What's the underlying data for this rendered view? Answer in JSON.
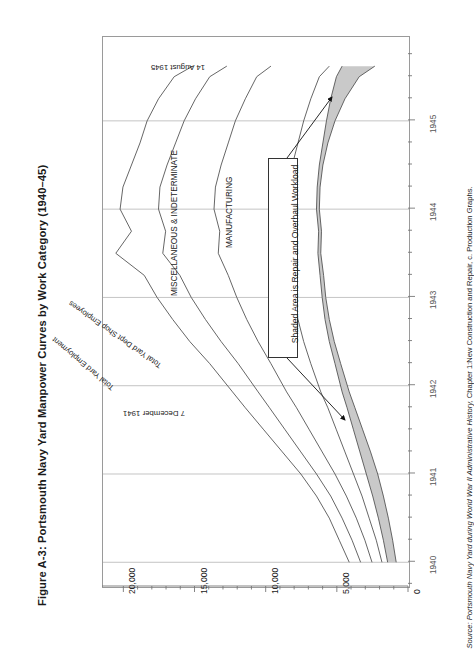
{
  "figure": {
    "title": "Figure A-3: Portsmouth Navy Yard Manpower Curves by Work Category (1940–45)",
    "source_prefix": "Source: ",
    "source_italic": "Portsmouth Navy Yard during World War II Administrative History,",
    "source_rest": " Chapter 1:New Construction and Repair, c. Production Graphs."
  },
  "axes": {
    "value_axis": {
      "title": "",
      "ticks": [
        "20,000",
        "15,000",
        "10,000",
        "5,000",
        "0"
      ],
      "tick_values": [
        20000,
        15000,
        10000,
        5000,
        0
      ],
      "minor_step": 1000,
      "min": 0,
      "max": 21500
    },
    "year_axis": {
      "ticks": [
        "1940",
        "1941",
        "1942",
        "1943",
        "1944",
        "1945"
      ],
      "tick_values": [
        1940,
        1941,
        1942,
        1943,
        1944,
        1945
      ],
      "min": 1939.72,
      "max": 1945.95,
      "minor_step": 0.25
    }
  },
  "series_labels": {
    "total_yard_employment": "Total Yard Employment",
    "total_yard_dept_shop": "Total Yard Dept Shop Employees",
    "miscellaneous": "MISCELLANEOUS & INDETERMINATE",
    "manufacturing": "MANUFACTURING",
    "new_construction": "NEW CONSTRUCTION"
  },
  "event_labels": {
    "pearl_harbor": "7 December 1941",
    "v_j_day": "14 August 1945"
  },
  "annotation": {
    "shaded_area_note": "Shaded Area is Repair and Overhaul Workload"
  },
  "colors": {
    "line": "#555555",
    "shade": "#c9c9c9",
    "grid": "#b5b5b5",
    "frame": "#9a9a9a",
    "text": "#1a1a1a"
  },
  "chart_data": {
    "type": "line",
    "title": "Figure A-3: Portsmouth Navy Yard Manpower Curves by Work Category (1940–45)",
    "xlabel": "Year",
    "ylabel": "Employees",
    "xlim": [
      1939.72,
      1945.95
    ],
    "ylim": [
      0,
      21500
    ],
    "grid": true,
    "orientation": "rotated-90 (years plotted vertically, employee counts horizontally)",
    "legend": "in-plot rotated text labels",
    "x": [
      1940.0,
      1940.25,
      1940.5,
      1940.75,
      1941.0,
      1941.25,
      1941.5,
      1941.75,
      1941.93,
      1942.25,
      1942.5,
      1942.75,
      1943.0,
      1943.25,
      1943.5,
      1943.75,
      1944.0,
      1944.25,
      1944.5,
      1944.75,
      1945.0,
      1945.25,
      1945.5,
      1945.62
    ],
    "series": [
      {
        "name": "Total Yard Employment",
        "values": [
          4200,
          4900,
          5600,
          6500,
          7600,
          8900,
          10200,
          11500,
          12400,
          14000,
          15400,
          16600,
          17700,
          18600,
          20600,
          19500,
          20300,
          20100,
          19500,
          18900,
          18400,
          17600,
          16500,
          15200
        ]
      },
      {
        "name": "Total Yard Dept Shop Employees",
        "values": [
          3400,
          4000,
          4700,
          5500,
          6500,
          7600,
          8700,
          9800,
          10600,
          12000,
          13200,
          14300,
          15300,
          16100,
          17300,
          17100,
          17600,
          17500,
          17000,
          16400,
          15800,
          15000,
          14000,
          12800
        ]
      },
      {
        "name": "Miscellaneous & Indeterminate (upper bound of band)",
        "values": [
          2600,
          3100,
          3700,
          4400,
          5200,
          6100,
          7000,
          7900,
          8600,
          9700,
          10600,
          11400,
          12100,
          12700,
          13400,
          13300,
          13700,
          13600,
          13200,
          12700,
          12200,
          11500,
          10700,
          9700
        ]
      },
      {
        "name": "Manufacturing",
        "values": [
          1900,
          2300,
          2800,
          3300,
          3900,
          4500,
          5100,
          5700,
          6200,
          6900,
          7400,
          7800,
          8100,
          8300,
          8500,
          8400,
          8600,
          8500,
          8200,
          7800,
          7400,
          6900,
          6300,
          5600
        ]
      },
      {
        "name": "Repair and Overhaul band — outer edge (shaded area top)",
        "values": [
          1500,
          1800,
          2150,
          2550,
          3000,
          3450,
          3900,
          4350,
          4700,
          5200,
          5600,
          5900,
          6100,
          6250,
          6400,
          6350,
          6500,
          6450,
          6300,
          6050,
          5800,
          5500,
          5100,
          4700
        ]
      },
      {
        "name": "New Construction (shaded area bottom / inner edge)",
        "values": [
          900,
          1150,
          1450,
          1800,
          2200,
          2700,
          3250,
          3800,
          4200,
          4800,
          5250,
          5600,
          5850,
          6000,
          6200,
          6150,
          6300,
          6250,
          6050,
          5700,
          5200,
          4500,
          3500,
          2400
        ]
      }
    ],
    "annotations": [
      {
        "text": "7 December 1941",
        "x": 1941.93,
        "note": "Pearl Harbor attack"
      },
      {
        "text": "14 August 1945",
        "x": 1945.62,
        "note": "V-J Day"
      },
      {
        "text": "Shaded Area is Repair and Overhaul Workload",
        "kind": "callout-box"
      }
    ]
  }
}
